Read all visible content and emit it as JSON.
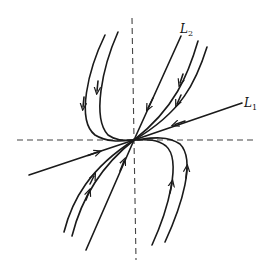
{
  "diagram": {
    "type": "phase-portrait",
    "labels": {
      "l1": {
        "main": "L",
        "sub": "1"
      },
      "l2": {
        "main": "L",
        "sub": "2"
      }
    },
    "origin": [
      134,
      140
    ],
    "colors": {
      "stroke": "#1a1a1a",
      "axis": "#444444",
      "background": "#ffffff"
    }
  }
}
